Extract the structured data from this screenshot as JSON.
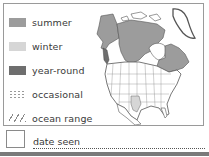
{
  "legend": {
    "items": [
      {
        "key": "summer",
        "label": "summer",
        "color": "#9c9c9c"
      },
      {
        "key": "winter",
        "label": "winter",
        "color": "#d6d6d6"
      },
      {
        "key": "year-round",
        "label": "year-round",
        "color": "#6e6e6e"
      },
      {
        "key": "occasional",
        "label": "occasional",
        "pattern": "dotted"
      },
      {
        "key": "ocean-range",
        "label": "ocean range",
        "pattern": "hatched"
      }
    ]
  },
  "map": {
    "region": "North America",
    "shaded_regions": [
      "Alaska (summer)",
      "Northern Canada (summer)",
      "Eastern Canada (summer)",
      "Texas (winter)"
    ]
  },
  "footer": {
    "date_label": "date seen",
    "date_value": ""
  },
  "colors": {
    "summer": "#9c9c9c",
    "winter": "#d6d6d6",
    "year_round": "#6e6e6e",
    "border": "#9a9a9a"
  }
}
